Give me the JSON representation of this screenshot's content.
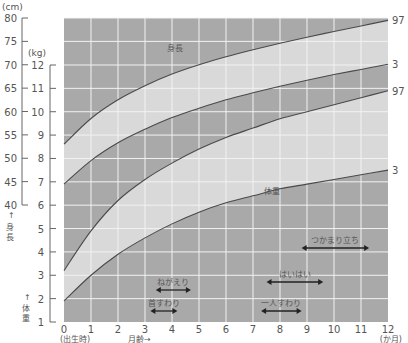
{
  "chart_data": {
    "type": "line",
    "xlabel": "月齢→",
    "x_unit": "(か月)",
    "x_start_label": "(出生時)",
    "x_ticks": [
      0,
      1,
      2,
      3,
      4,
      5,
      6,
      7,
      8,
      9,
      10,
      11,
      12
    ],
    "xlim": [
      0,
      12
    ],
    "y_axes": [
      {
        "name": "身長",
        "unit": "(cm)",
        "label": "↑身長",
        "ticks": [
          40,
          45,
          50,
          55,
          60,
          65,
          70,
          75,
          80
        ],
        "range": [
          40,
          80
        ]
      },
      {
        "name": "体重",
        "unit": "(kg)",
        "label": "↑体重",
        "ticks": [
          1,
          2,
          3,
          4,
          5,
          6,
          7,
          8,
          9,
          10,
          11,
          12
        ],
        "range": [
          1,
          12
        ]
      }
    ],
    "grid": true,
    "series": [
      {
        "name": "身長 97パーセンタイル",
        "axis": "cm",
        "end_label": "97",
        "x": [
          0,
          1,
          2,
          3,
          4,
          5,
          6,
          7,
          8,
          9,
          10,
          11,
          12
        ],
        "values": [
          53.0,
          58.5,
          62.5,
          65.5,
          68.0,
          70.0,
          71.7,
          73.2,
          74.6,
          75.9,
          77.1,
          78.3,
          79.5
        ]
      },
      {
        "name": "身長 3パーセンタイル",
        "axis": "cm",
        "end_label": "3",
        "x": [
          0,
          1,
          2,
          3,
          4,
          5,
          6,
          7,
          8,
          9,
          10,
          11,
          12
        ],
        "values": [
          44.5,
          49.5,
          53.3,
          56.2,
          58.7,
          60.7,
          62.5,
          64.0,
          65.4,
          66.7,
          67.9,
          69.0,
          70.1
        ]
      },
      {
        "name": "体重 97パーセンタイル",
        "axis": "kg",
        "end_label": "97",
        "x": [
          0,
          1,
          2,
          3,
          4,
          5,
          6,
          7,
          8,
          9,
          10,
          11,
          12
        ],
        "values": [
          3.2,
          4.9,
          6.2,
          7.1,
          7.8,
          8.4,
          8.9,
          9.3,
          9.7,
          10.0,
          10.3,
          10.6,
          10.9
        ]
      },
      {
        "name": "体重 3パーセンタイル",
        "axis": "kg",
        "end_label": "3",
        "x": [
          0,
          1,
          2,
          3,
          4,
          5,
          6,
          7,
          8,
          9,
          10,
          11,
          12
        ],
        "values": [
          1.9,
          3.0,
          3.9,
          4.6,
          5.2,
          5.7,
          6.1,
          6.4,
          6.7,
          6.9,
          7.1,
          7.3,
          7.5
        ]
      }
    ],
    "region_labels": [
      "身長",
      "体重"
    ],
    "milestones": [
      {
        "label": "首すわり",
        "from": 3.2,
        "to": 4.2
      },
      {
        "label": "ねがえり",
        "from": 3.4,
        "to": 4.7
      },
      {
        "label": "一人すわり",
        "from": 7.3,
        "to": 8.8
      },
      {
        "label": "はいはい",
        "from": 7.5,
        "to": 9.6
      },
      {
        "label": "つかまり立ち",
        "from": 8.8,
        "to": 11.3
      }
    ]
  },
  "labels": {
    "cm_unit": "(cm)",
    "kg_unit": "(kg)",
    "height_axis": "身長",
    "weight_axis": "体重",
    "height_region": "身長",
    "weight_region": "体重",
    "x_axis": "月齢",
    "x_unit": "(か月)",
    "birth": "(出生時)"
  },
  "colors": {
    "band_dark": "#a9a9a9",
    "band_light": "#d9d9d9",
    "grid": "#f2f2f2",
    "curve": "#4a4a4a",
    "text": "#555555"
  }
}
